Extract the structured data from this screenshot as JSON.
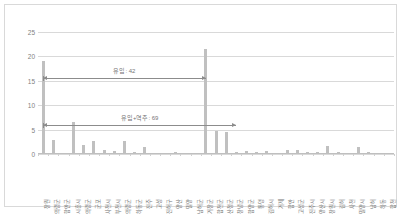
{
  "chart_data": {
    "type": "bar",
    "title": "",
    "subtitle": "",
    "xlabel": "",
    "ylabel": "",
    "ylim": [
      0,
      25
    ],
    "yticks": [
      0,
      5,
      10,
      15,
      20,
      25
    ],
    "grid": true,
    "legend": "none",
    "categories": [
      "창원",
      "의령군",
      "함안군",
      "시흥시",
      "의령군",
      "군포",
      "사천시",
      "부천시",
      "의령군",
      "하동군",
      "진주",
      "고성",
      "진해구",
      "양산",
      "밀양",
      "남해군",
      "거창군",
      "합천군",
      "산청군",
      "창녕군",
      "함양군",
      "통영",
      "김해시",
      "거제",
      "함안",
      "고성군",
      "진주시",
      "양산시",
      "창원시",
      "김해",
      "사천",
      "밀양시",
      "남해",
      "하동",
      "합천"
    ],
    "values": [
      19.0,
      2.8,
      0.2,
      6.6,
      1.8,
      2.6,
      0.8,
      0.6,
      2.6,
      0.5,
      1.5,
      0.3,
      0.3,
      0.4,
      0.2,
      0.3,
      21.5,
      4.7,
      4.6,
      0.5,
      0.6,
      0.4,
      0.7,
      0.3,
      0.8,
      0.9,
      0.5,
      0.5,
      1.7,
      0.5,
      0.3,
      1.4,
      0.4,
      0.3,
      0.2
    ]
  },
  "annotations": [
    {
      "id": "inflow",
      "label": "유입: 42",
      "value": 42,
      "y": 15.5,
      "start_index": 0,
      "end_index": 16
    },
    {
      "id": "inflow-plus-reverse",
      "label": "유입+역주: 69",
      "value": 69,
      "y": 6.0,
      "start_index": 0,
      "end_index": 19
    }
  ],
  "colors": {
    "bar": "#c0c0c0",
    "gridline": "#d9d9d9",
    "axis": "#bfbfbf",
    "text": "#767676",
    "annotation": "#8c8c8c",
    "background": "#ffffff",
    "frame": "#d9d9d9"
  }
}
